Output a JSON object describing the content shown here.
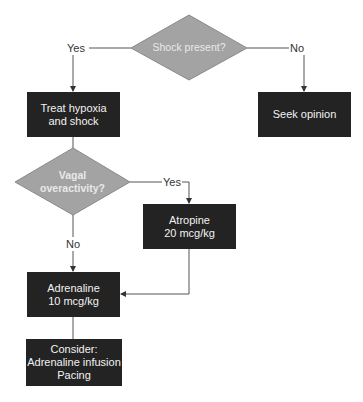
{
  "diagram": {
    "type": "flowchart",
    "colors": {
      "decision_fill": "#a3a3a3",
      "decision_stroke": "#8a8a8a",
      "process_fill": "#232323",
      "process_text": "#f2f2f2",
      "line": "#555555"
    },
    "decisions": [
      {
        "id": "shock",
        "text": "Shock present?"
      },
      {
        "id": "vagal",
        "text": "Vagal\noveractivity?"
      }
    ],
    "processes": [
      {
        "id": "treat",
        "text": "Treat hypoxia\nand shock"
      },
      {
        "id": "seek",
        "text": "Seek opinion"
      },
      {
        "id": "atropine",
        "text": "Atropine\n20 mcg/kg"
      },
      {
        "id": "adrenaline",
        "text": "Adrenaline\n10 mcg/kg"
      },
      {
        "id": "consider",
        "text": "Consider:\nAdrenaline infusion\nPacing"
      }
    ],
    "edge_labels": {
      "shock_yes": "Yes",
      "shock_no": "No",
      "vagal_yes": "Yes",
      "vagal_no": "No"
    },
    "edges": [
      {
        "from": "shock",
        "to": "treat",
        "label": "Yes"
      },
      {
        "from": "shock",
        "to": "seek",
        "label": "No"
      },
      {
        "from": "treat",
        "to": "vagal",
        "label": ""
      },
      {
        "from": "vagal",
        "to": "atropine",
        "label": "Yes"
      },
      {
        "from": "vagal",
        "to": "adrenaline",
        "label": "No"
      },
      {
        "from": "atropine",
        "to": "adrenaline",
        "label": ""
      },
      {
        "from": "adrenaline",
        "to": "consider",
        "label": ""
      }
    ]
  }
}
